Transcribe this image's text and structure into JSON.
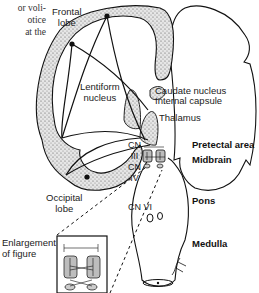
{
  "page_text_fragments": [
    "or voli-",
    "otice",
    " at the"
  ],
  "labels": {
    "frontal_lobe": [
      "Frontal",
      "lobe"
    ],
    "lentiform_nucleus": [
      "Lentiform",
      "nucleus"
    ],
    "caudate_nucleus": "Caudate nucleus",
    "internal_capsule": "Internal capsule",
    "thalamus": "Thalamus",
    "cn3": [
      "CN",
      "III"
    ],
    "cn4": [
      "CN",
      "IV"
    ],
    "cn6": "CN VI",
    "pretectal_area": "Pretectal area",
    "midbrain": "Midbrain",
    "pons": "Pons",
    "medulla": "Medulla",
    "occipital_lobe": [
      "Occipital",
      "lobe"
    ],
    "enlargement": [
      "Enlargement",
      "of figure"
    ]
  },
  "colors": {
    "line": "#111111",
    "stipple_fill": "#d9d9d9",
    "inset_fill": "#bdbdbd"
  }
}
